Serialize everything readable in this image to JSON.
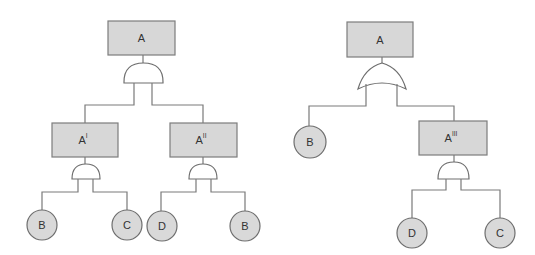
{
  "diagram": {
    "type": "fault-tree-comparison",
    "colors": {
      "box_fill": "#d7d7d7",
      "circle_fill": "#d9d9d9",
      "stroke": "#6e6e6e",
      "background": "#ffffff"
    },
    "left_tree": {
      "top_event": {
        "label": "A",
        "gate": "AND"
      },
      "intermediate": [
        {
          "label": "A",
          "sup": "I",
          "gate": "AND",
          "children": [
            "B",
            "C"
          ]
        },
        {
          "label": "A",
          "sup": "II",
          "gate": "AND",
          "children": [
            "D",
            "B"
          ]
        }
      ]
    },
    "right_tree": {
      "top_event": {
        "label": "A",
        "gate": "OR"
      },
      "basic": {
        "label": "B"
      },
      "intermediate": {
        "label": "A",
        "sup": "III",
        "gate": "AND",
        "children": [
          "D",
          "C"
        ]
      }
    }
  }
}
